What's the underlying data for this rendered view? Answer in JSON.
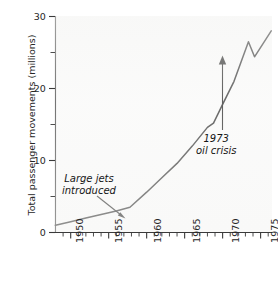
{
  "chart_data": {
    "type": "line",
    "title": "",
    "xlabel": "",
    "ylabel": "Total passenger movements (millions)",
    "xlim": [
      1948,
      1976.5
    ],
    "ylim": [
      0,
      30
    ],
    "grid": false,
    "legend": "none",
    "x_major_ticks": [
      1950,
      1955,
      1960,
      1965,
      1970,
      1975
    ],
    "x_major_tick_labels": [
      "1950",
      "1955",
      "1960",
      "1965",
      "1970",
      "1975"
    ],
    "x_minor_tick_interval": 1,
    "y_major_ticks": [
      0,
      10,
      20,
      30
    ],
    "y_major_tick_labels": [
      "0",
      "10",
      "20",
      "30"
    ],
    "y_minor_ticks": [
      5,
      15,
      25
    ],
    "series": [
      {
        "name": "Total passenger movements",
        "x": [
          1948.0,
          1950.0,
          1952.0,
          1954.0,
          1956.0,
          1957.8,
          1960.0,
          1962.0,
          1964.0,
          1966.0,
          1968.0,
          1968.8,
          1970.0,
          1971.5,
          1973.4,
          1974.2,
          1976.4
        ],
        "values": [
          1.0,
          1.5,
          2.0,
          2.5,
          3.0,
          3.5,
          5.6,
          7.6,
          9.6,
          12.0,
          14.6,
          15.2,
          17.8,
          21.0,
          26.5,
          24.4,
          28.0
        ]
      }
    ],
    "annotations": [
      {
        "id": "large-jets",
        "text_line1": "Large jets",
        "text_line2": "introduced",
        "style": "italic",
        "points_to_x": 1957.8,
        "points_to_y": 3.5
      },
      {
        "id": "oil-crisis",
        "text_line1": "1973",
        "text_line2": "oil crisis",
        "style": "italic",
        "points_to_x": 1974.2,
        "points_to_y": 24.4
      }
    ],
    "colors": {
      "line": "#2a2a2a",
      "axis": "#3a3a3a",
      "text": "#262626",
      "background": "#fbfbfb"
    }
  }
}
